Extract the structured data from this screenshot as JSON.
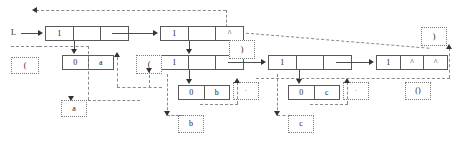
{
  "diagram": {
    "root_label": "L",
    "colors": {
      "solid_stroke": "#595959",
      "dashed_stroke": "#8a8a8a",
      "arrow": "#333333",
      "background": "#ffffff",
      "text": "#1a1a1a"
    },
    "cons_cells": [
      {
        "id": "c1",
        "fields": [
          "1",
          "",
          ""
        ]
      },
      {
        "id": "c2",
        "fields": [
          "1",
          "",
          "^"
        ]
      },
      {
        "id": "c3",
        "fields": [
          "1",
          "",
          ""
        ]
      },
      {
        "id": "c4",
        "fields": [
          "1",
          "",
          ""
        ]
      },
      {
        "id": "c5",
        "fields": [
          "1",
          "^",
          "^"
        ]
      },
      {
        "id": "c6",
        "fields": [
          "0",
          "a"
        ]
      },
      {
        "id": "c7",
        "fields": [
          "0",
          "b"
        ]
      },
      {
        "id": "c8",
        "fields": [
          "0",
          "c"
        ]
      }
    ],
    "leaf_boxes": [
      {
        "id": "l1",
        "text": "("
      },
      {
        "id": "l2",
        "text": "a"
      },
      {
        "id": "l3",
        "text": "·"
      },
      {
        "id": "l4",
        "text": "("
      },
      {
        "id": "l5",
        "text": ")"
      },
      {
        "id": "l6",
        "text": "b"
      },
      {
        "id": "l7",
        "text": "·"
      },
      {
        "id": "l8",
        "text": "c"
      },
      {
        "id": "l9",
        "text": "·"
      },
      {
        "id": "l10",
        "text": ")"
      },
      {
        "id": "l11",
        "text": "()"
      }
    ]
  }
}
